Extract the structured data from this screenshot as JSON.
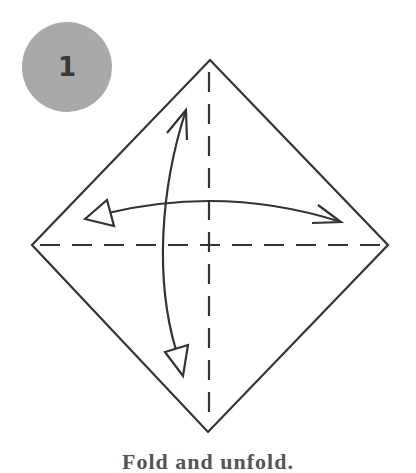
{
  "step": {
    "number": "1",
    "badge_color": "#a9a9a9",
    "number_color": "#3a3a3a"
  },
  "diagram": {
    "line_color": "#333333",
    "shape": "square-paper-diamond",
    "creases": [
      "vertical-valley-fold-dashed",
      "horizontal-valley-fold-dashed"
    ],
    "arrows": [
      "fold-and-unfold-vertical",
      "fold-and-unfold-horizontal"
    ]
  },
  "caption": {
    "text": "Fold and unfold.",
    "color": "#555555"
  }
}
